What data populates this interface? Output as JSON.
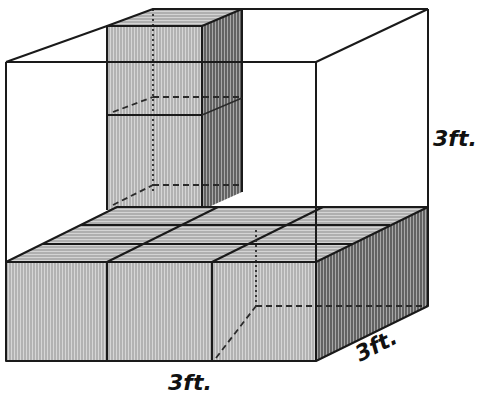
{
  "figure": {
    "colors": {
      "line": "#1a1a1a",
      "front_fill": "#bdbdbd",
      "top_fill": "#c9c9c9",
      "side_fill": "#8a8a8a",
      "background": "#ffffff"
    }
  },
  "labels": {
    "height": "3ft.",
    "width": "3ft.",
    "depth": "3ft."
  }
}
